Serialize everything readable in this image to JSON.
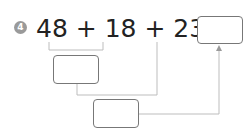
{
  "problem": {
    "number": "4",
    "expression": "48 + 18 + 23 =",
    "operands": [
      "48",
      "18",
      "23"
    ],
    "operator": "+",
    "equals": "="
  },
  "boxes": {
    "answer": "",
    "first_sum": "",
    "second_sum": ""
  },
  "colors": {
    "badge": "#9a9a9a",
    "line": "#bdbdbd",
    "box_border": "#777777"
  }
}
